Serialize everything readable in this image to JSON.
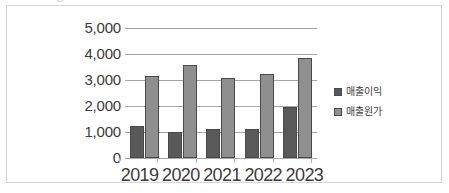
{
  "top_artifact": "ㅁ",
  "chart_data": {
    "type": "bar",
    "title": "",
    "subtitle": "",
    "xlabel": "",
    "ylabel": "",
    "categories": [
      "2019",
      "2020",
      "2021",
      "2022",
      "2023"
    ],
    "series": [
      {
        "name": "매출이익",
        "color": "#595959",
        "values": [
          1220,
          990,
          1110,
          1100,
          1950
        ]
      },
      {
        "name": "매출원가",
        "color": "#8f8f8f",
        "values": [
          3150,
          3580,
          3080,
          3250,
          3850
        ]
      }
    ],
    "ylim": [
      0,
      5000
    ],
    "yticks": [
      5000,
      4000,
      3000,
      2000,
      1000,
      0
    ],
    "ytick_labels": [
      "5,000",
      "4,000",
      "3,000",
      "2,000",
      "1,000",
      "0"
    ],
    "grid": true,
    "grid_axis": "y",
    "legend": true,
    "legend_position": "right",
    "legend_entries": [
      "매출이익",
      "매출원가"
    ],
    "gridline_color": "#a6a6a6",
    "frame_color": "#d5d5d5",
    "text_color": "#3b3b3b",
    "background": "#ffffff"
  }
}
